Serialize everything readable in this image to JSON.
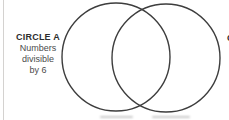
{
  "diagram": {
    "type": "venn-diagram",
    "circle_a": {
      "title": "CIRCLE A",
      "lines": [
        "Numbers",
        "divisible",
        "by 6"
      ]
    },
    "circle_b": {
      "partial_text": "C"
    }
  },
  "colors": {
    "background": "#ffffff",
    "circle_stroke": "#3d3d3d",
    "title_text": "#2d2d2d",
    "body_text": "#4b4b4b",
    "edge_line": "#d4d2d0",
    "cutoff_smudge": "#bdbdbd"
  }
}
